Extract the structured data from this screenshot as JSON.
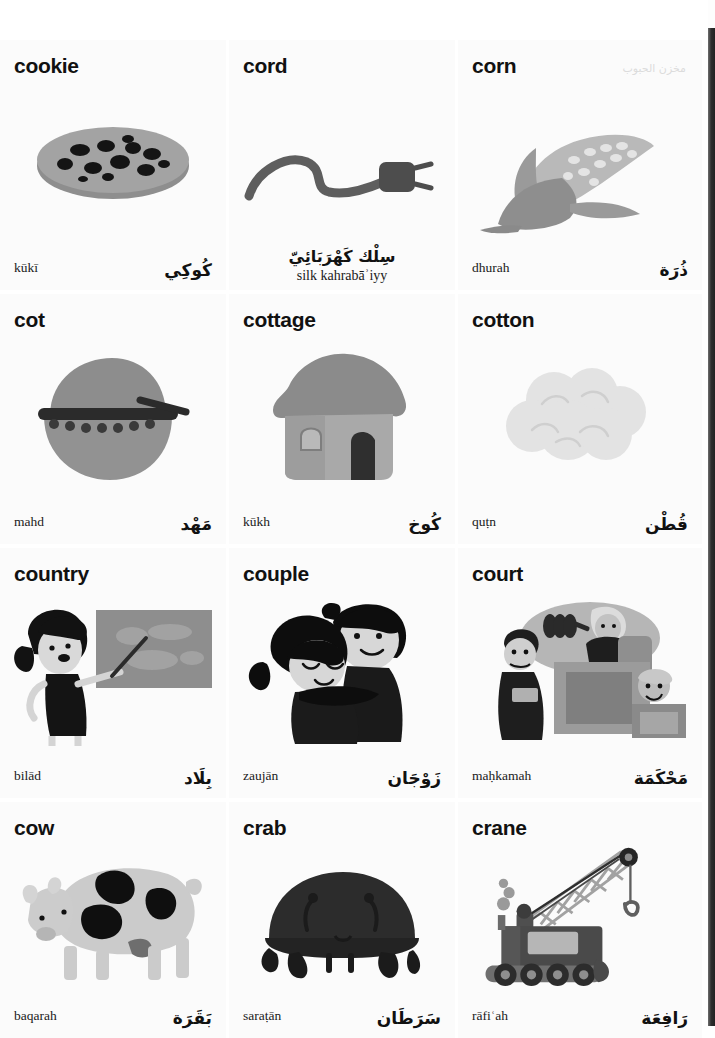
{
  "page": {
    "kind": "picture-dictionary-page",
    "columns": 3,
    "rows": 4,
    "ghost_text": "مخزن الحبوب"
  },
  "entries": [
    {
      "headword": "cookie",
      "transliteration": "kūkī",
      "arabic": "كُوكِي",
      "layout": "split",
      "illustration": "chocolate-chip-cookie",
      "colors": {
        "body": "#9a9a9a",
        "chips": "#141414",
        "shadow": "#7e7e7e"
      }
    },
    {
      "headword": "cord",
      "transliteration": "silk kahrabāʾiyy",
      "arabic": "سِلْك كَهْرَبَائِيّ",
      "layout": "centered",
      "illustration": "electrical-cord-with-plug",
      "colors": {
        "body": "#5e5e5e",
        "plug": "#4a4a4a"
      }
    },
    {
      "headword": "corn",
      "transliteration": "dhurah",
      "arabic": "ذُرَة",
      "layout": "split",
      "illustration": "corn-cob-with-husk",
      "colors": {
        "husk": "#9d9d9d",
        "kernels": "#cfcfcf",
        "leaf": "#8c8c8c"
      }
    },
    {
      "headword": "cot",
      "transliteration": "mahd",
      "arabic": "مَهْد",
      "layout": "split",
      "illustration": "baby-cot-cradle",
      "colors": {
        "body": "#8f8f8f",
        "hood": "#9c9c9c",
        "rail": "#2a2a2a"
      }
    },
    {
      "headword": "cottage",
      "transliteration": "kūkh",
      "arabic": "كُوخ",
      "layout": "split",
      "illustration": "thatched-cottage-house",
      "colors": {
        "roof": "#8a8a8a",
        "wall": "#a9a9a9",
        "door": "#3b3b3b"
      }
    },
    {
      "headword": "cotton",
      "transliteration": "quṭn",
      "arabic": "قُطْن",
      "layout": "split",
      "illustration": "cotton-boll-cloud",
      "colors": {
        "body": "#e2e2e2",
        "outline": "#cdcdcd"
      }
    },
    {
      "headword": "country",
      "transliteration": "bilād",
      "arabic": "بِلَاد",
      "layout": "split",
      "illustration": "girl-pointing-at-world-map",
      "colors": {
        "board": "#8d8d8d",
        "hair": "#141414",
        "skin": "#d9d9d9"
      }
    },
    {
      "headword": "couple",
      "transliteration": "zaujān",
      "arabic": "زَوْجَان",
      "layout": "split",
      "illustration": "man-and-woman-embracing",
      "colors": {
        "hair": "#0d0d0d",
        "skin": "#d7d7d7",
        "clothes": "#1a1a1a"
      }
    },
    {
      "headword": "court",
      "transliteration": "maḥkamah",
      "arabic": "مَحْكَمَة",
      "layout": "split",
      "illustration": "courtroom-judge-lawyer-witness",
      "colors": {
        "backdrop": "#b4b4b4",
        "bench": "#9b9b9b",
        "robe": "#1e1e1e"
      }
    },
    {
      "headword": "cow",
      "transliteration": "baqarah",
      "arabic": "بَقَرَة",
      "layout": "split",
      "illustration": "spotted-dairy-cow",
      "colors": {
        "body": "#cbcbcb",
        "spots": "#0f0f0f",
        "udder": "#7a7a7a"
      }
    },
    {
      "headword": "crab",
      "transliteration": "saraṭān",
      "arabic": "سَرَطَان",
      "layout": "split",
      "illustration": "dark-crab",
      "colors": {
        "shell": "#2b2b2b",
        "legs": "#1b1b1b"
      }
    },
    {
      "headword": "crane",
      "transliteration": "rāfiʿah",
      "arabic": "رَافِعَة",
      "layout": "split",
      "illustration": "crawler-crane-with-lattice-boom",
      "colors": {
        "body": "#585858",
        "boom": "#a2a2a2",
        "tracks": "#6a6a6a"
      }
    }
  ]
}
